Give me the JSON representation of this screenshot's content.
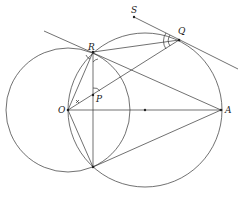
{
  "diagram": {
    "type": "geometry",
    "points": {
      "O": {
        "label": "O",
        "x": 68,
        "y": 110
      },
      "A": {
        "label": "A",
        "x": 221,
        "y": 110
      },
      "M": {
        "label": "",
        "x": 145,
        "y": 110
      },
      "R": {
        "label": "R",
        "x": 93,
        "y": 52
      },
      "T": {
        "label": "",
        "x": 93,
        "y": 167
      },
      "P": {
        "label": "P",
        "x": 93,
        "y": 95
      },
      "Q": {
        "label": "Q",
        "x": 179,
        "y": 40
      },
      "S": {
        "label": "S",
        "x": 134,
        "y": 17
      }
    },
    "circles": [
      {
        "name": "circle-O",
        "cx": 68,
        "cy": 110,
        "r": 62
      },
      {
        "name": "circle-M",
        "cx": 145,
        "cy": 110,
        "r": 77
      }
    ],
    "stroke_color": "#333333"
  }
}
